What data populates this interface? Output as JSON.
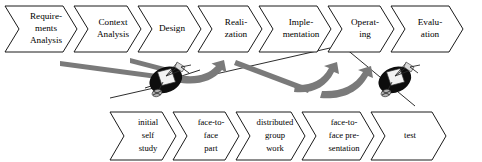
{
  "diagram": {
    "colors": {
      "outline": "#1a1a1a",
      "chevron_fill": "#ffffff",
      "arrow_gray": "#7a7a7a",
      "dish_dark": "#0d0d0d",
      "background": "#ffffff"
    },
    "top_row": {
      "name": "process-phases",
      "font_size": 9.2,
      "items": [
        {
          "id": "requirements-analysis",
          "lines": [
            "Require-",
            "ments",
            "Analysis"
          ],
          "x": 5,
          "w": 72
        },
        {
          "id": "context-analysis",
          "lines": [
            "Context",
            "Analysis"
          ],
          "x": 74,
          "w": 67
        },
        {
          "id": "design",
          "lines": [
            "Design"
          ],
          "x": 138,
          "w": 63
        },
        {
          "id": "realization",
          "lines": [
            "Reali-",
            "zation"
          ],
          "x": 198,
          "w": 64
        },
        {
          "id": "implementation",
          "lines": [
            "Imple-",
            "mentation"
          ],
          "x": 259,
          "w": 72
        },
        {
          "id": "operating",
          "lines": [
            "Operat-",
            "ing"
          ],
          "x": 328,
          "w": 66
        },
        {
          "id": "evaluation",
          "lines": [
            "Evalu-",
            "ation"
          ],
          "x": 391,
          "w": 72
        }
      ]
    },
    "bottom_row": {
      "name": "learning-activities",
      "font_size": 8.6,
      "items": [
        {
          "id": "initial-self-study",
          "lines": [
            "initial",
            "self",
            "study"
          ],
          "x": 110,
          "w": 66
        },
        {
          "id": "face-to-face-part",
          "lines": [
            "face-to-",
            "face",
            "part"
          ],
          "x": 173,
          "w": 66
        },
        {
          "id": "distributed-group-work",
          "lines": [
            "distributed",
            "group",
            "work"
          ],
          "x": 236,
          "w": 69
        },
        {
          "id": "face-to-face-presentation",
          "lines": [
            "face-to-",
            "face pre-",
            "sentation"
          ],
          "x": 302,
          "w": 72
        },
        {
          "id": "test",
          "lines": [
            "test"
          ],
          "x": 371,
          "w": 75
        }
      ]
    },
    "connectors": {
      "name": "flow-arrows",
      "count": 3,
      "description": "gray curved feedback arrows and thin diagonal guide lines"
    },
    "dishes": [
      {
        "id": "satellite-dish-left",
        "cx": 165,
        "cy": 78
      },
      {
        "id": "satellite-dish-right",
        "cx": 394,
        "cy": 78
      }
    ]
  }
}
